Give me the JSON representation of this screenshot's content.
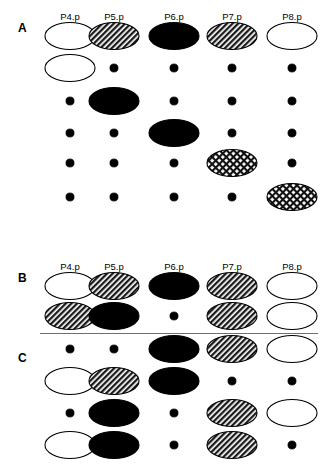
{
  "figure": {
    "width": 329,
    "height": 465,
    "background": "#ffffff",
    "ink_color": "#000000",
    "divider_color": "#6f6f6f"
  },
  "columns": [
    {
      "label": "P4.p",
      "x": 70
    },
    {
      "label": "P5.p",
      "x": 114
    },
    {
      "label": "P6.p",
      "x": 174
    },
    {
      "label": "P7.p",
      "x": 232
    },
    {
      "label": "P8.p",
      "x": 292
    }
  ],
  "legend": {
    "symbols": [
      {
        "key": "open",
        "name": "open-ellipse",
        "description": "unfilled ellipse"
      },
      {
        "key": "hatched",
        "name": "hatched-ellipse",
        "description": "diagonally hatched ellipse"
      },
      {
        "key": "filled",
        "name": "filled-ellipse",
        "description": "solid black ellipse"
      },
      {
        "key": "crosshatched",
        "name": "crosshatched-ellipse",
        "description": "cross hatched ellipse"
      },
      {
        "key": "dot",
        "name": "small-dot",
        "description": "small solid dot"
      }
    ]
  },
  "panels": [
    {
      "id": "A",
      "label": "A",
      "label_x": 18,
      "label_y": 22,
      "header_y": 12,
      "row_ys": [
        36,
        68,
        101,
        133,
        163,
        197
      ],
      "rows": [
        [
          "open",
          "hatched",
          "filled",
          "hatched",
          "open"
        ],
        [
          "open",
          "dot",
          "dot",
          "dot",
          "dot"
        ],
        [
          "dot",
          "filled",
          "dot",
          "dot",
          "dot"
        ],
        [
          "dot",
          "dot",
          "filled",
          "dot",
          "dot"
        ],
        [
          "dot",
          "dot",
          "dot",
          "crosshatched",
          "dot"
        ],
        [
          "dot",
          "dot",
          "dot",
          "dot",
          "crosshatched"
        ]
      ]
    },
    {
      "id": "B",
      "label": "B",
      "label_x": 18,
      "label_y": 272,
      "header_y": 262,
      "row_ys": [
        286,
        316
      ],
      "rows": [
        [
          "open",
          "hatched",
          "filled",
          "hatched",
          "open"
        ],
        [
          "hatched",
          "filled",
          "dot",
          "hatched",
          "open"
        ]
      ]
    },
    {
      "id": "C",
      "label": "C",
      "label_x": 18,
      "label_y": 352,
      "row_ys": [
        349,
        381,
        413,
        445
      ],
      "rows": [
        [
          "dot",
          "dot",
          "filled",
          "hatched",
          "open"
        ],
        [
          "open",
          "hatched",
          "filled",
          "dot",
          "dot"
        ],
        [
          "dot",
          "filled",
          "dot",
          "hatched",
          "open"
        ],
        [
          "open",
          "filled",
          "dot",
          "hatched",
          "dot"
        ]
      ]
    }
  ],
  "divider": {
    "x": 40,
    "y": 333,
    "width": 278
  }
}
